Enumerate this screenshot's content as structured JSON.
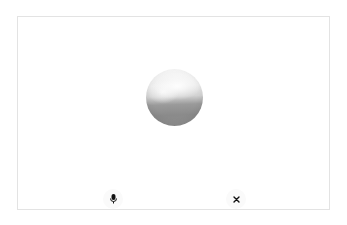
{
  "app": {
    "view": "voice-mode"
  },
  "orb": {
    "state": "idle",
    "colors": {
      "top": "#f7f7f7",
      "bottom": "#8a8a8a"
    }
  },
  "controls": {
    "mic": {
      "icon": "microphone-icon",
      "color": "#111111"
    },
    "close": {
      "icon": "close-icon",
      "color": "#111111"
    }
  },
  "frame": {
    "border_color": "#e3e3e3",
    "background": "#ffffff"
  }
}
